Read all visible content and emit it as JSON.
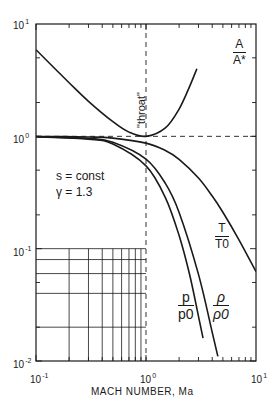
{
  "chart_data": {
    "type": "line",
    "title": "",
    "xlabel": "MACH NUMBER, Ma",
    "ylabel": "",
    "xscale": "log",
    "yscale": "log",
    "xlim": [
      0.1,
      10
    ],
    "ylim": [
      0.01,
      10
    ],
    "x_tick_labels": [
      "10^-1",
      "10^0",
      "10^1"
    ],
    "y_tick_labels": [
      "10^-2",
      "10^-1",
      "10^0",
      "10^1"
    ],
    "grid": "partial (lower-left inset grid)",
    "annotations": [
      "\"throat\"",
      "s = const",
      "γ = 1.3"
    ],
    "reference_lines": [
      {
        "type": "vertical",
        "x": 1,
        "style": "dashed"
      },
      {
        "type": "horizontal",
        "y": 1,
        "style": "dashed"
      }
    ],
    "gamma": 1.3,
    "series": [
      {
        "name": "A/A*",
        "x": [
          0.1,
          0.2,
          0.3,
          0.5,
          0.7,
          1.0,
          1.5,
          2.0,
          2.5,
          2.9
        ],
        "y": [
          5.9,
          3.0,
          2.05,
          1.35,
          1.09,
          1.0,
          1.19,
          1.75,
          2.8,
          4.0
        ]
      },
      {
        "name": "T/T0",
        "x": [
          0.1,
          0.3,
          0.5,
          1.0,
          1.5,
          2.0,
          3.0,
          4.0,
          5.0,
          7.0,
          10.0
        ],
        "y": [
          0.998,
          0.987,
          0.964,
          0.87,
          0.748,
          0.625,
          0.426,
          0.294,
          0.211,
          0.12,
          0.0625
        ]
      },
      {
        "name": "p/p0",
        "x": [
          0.1,
          0.3,
          0.5,
          1.0,
          1.5,
          2.0,
          2.5,
          3.0,
          3.3
        ],
        "y": [
          0.993,
          0.945,
          0.854,
          0.546,
          0.285,
          0.131,
          0.058,
          0.025,
          0.016
        ]
      },
      {
        "name": "ρ/ρ0",
        "x": [
          0.1,
          0.3,
          0.5,
          1.0,
          1.5,
          2.0,
          3.0,
          4.0,
          4.5
        ],
        "y": [
          0.995,
          0.957,
          0.885,
          0.627,
          0.381,
          0.21,
          0.059,
          0.018,
          0.011
        ]
      }
    ]
  },
  "labels": {
    "x_axis": "MACH NUMBER, Ma",
    "throat": "\"throat\"",
    "condition1": "s = const",
    "condition2": "γ = 1.3",
    "area_num": "A",
    "area_den": "A*",
    "temp_num": "T",
    "temp_den": "T0",
    "press_num": "p",
    "press_den": "p0",
    "dens_num": "ρ",
    "dens_den": "ρ0"
  },
  "ticks": {
    "x": [
      {
        "base": "10",
        "exp": "-1"
      },
      {
        "base": "10",
        "exp": "0"
      },
      {
        "base": "10",
        "exp": "1"
      }
    ],
    "y": [
      {
        "base": "10",
        "exp": "1"
      },
      {
        "base": "10",
        "exp": "0"
      },
      {
        "base": "10",
        "exp": "-1"
      },
      {
        "base": "10",
        "exp": "-2"
      }
    ]
  }
}
